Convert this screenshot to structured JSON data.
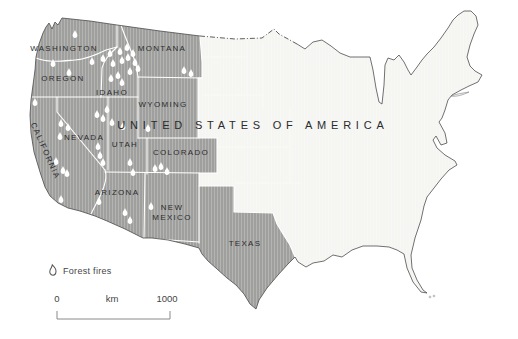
{
  "map": {
    "title": "UNITED STATES OF AMERICA",
    "colors": {
      "highlight": "#9f9f9d",
      "base": "#f5f5f2",
      "border": "#4d4d4d",
      "state_line": "#ffffff",
      "label": "#2d2d2d",
      "fire": "#ffffff"
    },
    "state_labels": [
      {
        "label": "WASHINGTON",
        "x": 64,
        "y": 51
      },
      {
        "label": "MONTANA",
        "x": 162,
        "y": 51
      },
      {
        "label": "OREGON",
        "x": 63,
        "y": 81
      },
      {
        "label": "IDAHO",
        "x": 112,
        "y": 95
      },
      {
        "label": "WYOMING",
        "x": 163,
        "y": 107
      },
      {
        "label": "NEVADA",
        "x": 84,
        "y": 140
      },
      {
        "label": "UTAH",
        "x": 125,
        "y": 147
      },
      {
        "label": "COLORADO",
        "x": 181,
        "y": 155
      },
      {
        "label": "CALIFORNIA",
        "x": 43,
        "y": 152,
        "rotate": 66
      },
      {
        "label": "ARIZONA",
        "x": 117,
        "y": 195
      },
      {
        "label": "NEW",
        "x": 172,
        "y": 210
      },
      {
        "label": "MEXICO",
        "x": 172,
        "y": 220
      },
      {
        "label": "TEXAS",
        "x": 245,
        "y": 246
      }
    ],
    "fires": [
      [
        75,
        34
      ],
      [
        53,
        63
      ],
      [
        69,
        72
      ],
      [
        92,
        61
      ],
      [
        35,
        102
      ],
      [
        103,
        58
      ],
      [
        110,
        53
      ],
      [
        113,
        63
      ],
      [
        120,
        51
      ],
      [
        122,
        60
      ],
      [
        127,
        47
      ],
      [
        128,
        57
      ],
      [
        133,
        53
      ],
      [
        135,
        62
      ],
      [
        138,
        68
      ],
      [
        130,
        71
      ],
      [
        118,
        75
      ],
      [
        111,
        78
      ],
      [
        122,
        82
      ],
      [
        184,
        70
      ],
      [
        191,
        73
      ],
      [
        107,
        109
      ],
      [
        97,
        114
      ],
      [
        103,
        118
      ],
      [
        61,
        123
      ],
      [
        68,
        127
      ],
      [
        60,
        136
      ],
      [
        112,
        122
      ],
      [
        123,
        126
      ],
      [
        98,
        146
      ],
      [
        100,
        155
      ],
      [
        103,
        162
      ],
      [
        148,
        128
      ],
      [
        130,
        162
      ],
      [
        133,
        172
      ],
      [
        33,
        163
      ],
      [
        56,
        161
      ],
      [
        63,
        170
      ],
      [
        67,
        173
      ],
      [
        36,
        185
      ],
      [
        61,
        199
      ],
      [
        155,
        168
      ],
      [
        161,
        166
      ],
      [
        167,
        171
      ],
      [
        125,
        212
      ],
      [
        130,
        220
      ],
      [
        99,
        201
      ],
      [
        151,
        206
      ]
    ]
  },
  "legend": {
    "label": "Forest fires"
  },
  "scale_bar": {
    "start": "0",
    "unit": "km",
    "end": "1000"
  }
}
